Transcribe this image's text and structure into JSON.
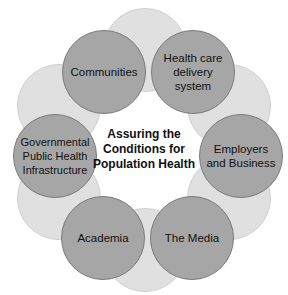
{
  "diagram": {
    "center_label": [
      "Assuring the",
      "Conditions for",
      "Population Health"
    ],
    "nodes": [
      {
        "label": "Communities"
      },
      {
        "label": "Health care delivery system"
      },
      {
        "label": "Employers and Business"
      },
      {
        "label": "The Media"
      },
      {
        "label": "Academia"
      },
      {
        "label": "Governmental Public Health Infrastructure"
      }
    ],
    "colors": {
      "node_fill": "#a6a6a6",
      "node_border": "#7a7a7a",
      "connector_fill": "#e0e0e0"
    }
  }
}
